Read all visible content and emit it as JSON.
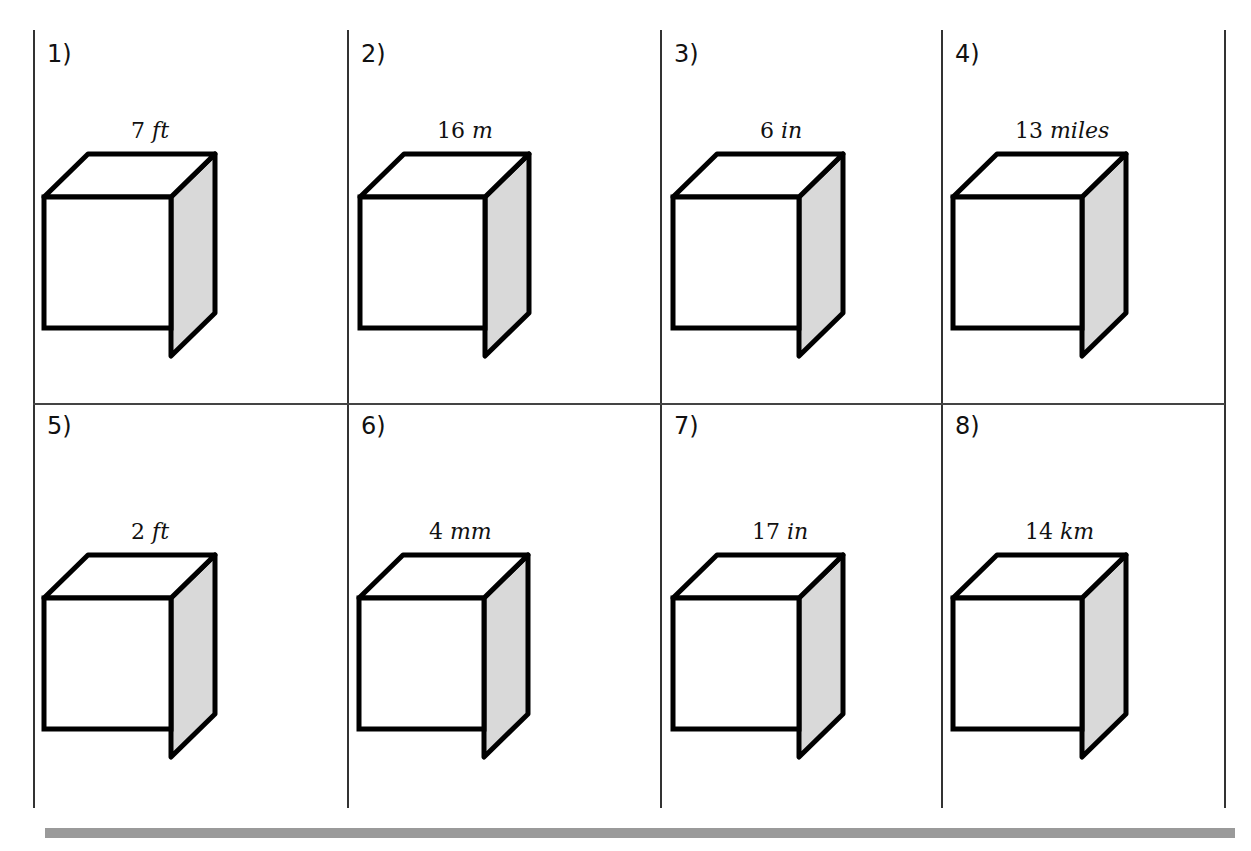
{
  "worksheet": {
    "problems": [
      {
        "number": "1)",
        "value": "7",
        "unit": "ft"
      },
      {
        "number": "2)",
        "value": "16",
        "unit": "m"
      },
      {
        "number": "3)",
        "value": "6",
        "unit": "in"
      },
      {
        "number": "4)",
        "value": "13",
        "unit": "miles"
      },
      {
        "number": "5)",
        "value": "2",
        "unit": "ft"
      },
      {
        "number": "6)",
        "value": "4",
        "unit": "mm"
      },
      {
        "number": "7)",
        "value": "17",
        "unit": "in"
      },
      {
        "number": "8)",
        "value": "14",
        "unit": "km"
      }
    ],
    "colors": {
      "outline": "#000000",
      "side_face": "#d9d9d9",
      "front_face": "#ffffff",
      "bottom_bar": "#9a9a9a"
    }
  }
}
